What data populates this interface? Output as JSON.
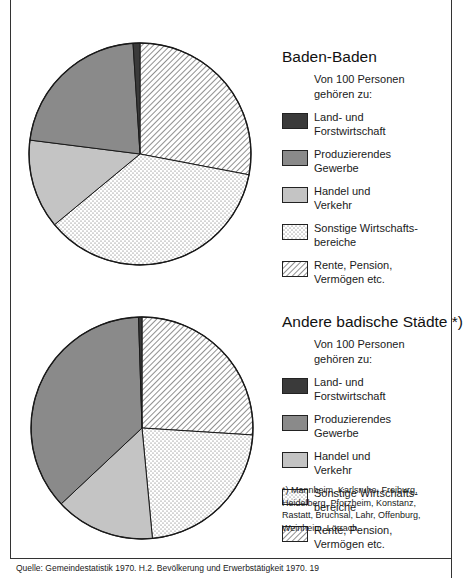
{
  "chart_data": [
    {
      "type": "pie",
      "title": "Baden-Baden",
      "subtitle": "Von 100 Personen gehören zu:",
      "unit": "persons per 100",
      "categories": [
        "Land- und Forstwirtschaft",
        "Produzierendes Gewerbe",
        "Handel und Verkehr",
        "Sonstige Wirtschaftsbereiche",
        "Rente, Pension, Vermögen etc."
      ],
      "values": [
        1,
        22,
        13,
        36,
        28
      ],
      "start_angle_deg": 0,
      "direction": "counterclockwise-from-top for order Land → Produzierendes → Handel → Sonstige → Rente",
      "legend_position": "right"
    },
    {
      "type": "pie",
      "title": "Andere badische Städte *)",
      "subtitle": "Von 100 Personen gehören zu:",
      "unit": "persons per 100",
      "categories": [
        "Land- und Forstwirtschaft",
        "Produzierendes Gewerbe",
        "Handel und Verkehr",
        "Sonstige Wirtschaftsbereiche",
        "Rente, Pension, Vermögen etc."
      ],
      "values": [
        0.5,
        36.5,
        14.5,
        22.5,
        26
      ],
      "start_angle_deg": 0,
      "legend_position": "right",
      "footnote": "*) Mannheim, Karlsruhe, Freiburg, Heidelberg, Pforzheim, Konstanz, Rastatt, Bruchsal, Lahr, Offenburg, Weinheim, Lörrach."
    }
  ],
  "colors": {
    "land": "#3a3a3a",
    "produzierendes": "#8a8a8a",
    "handel": "#c4c4c4",
    "sonstige": "dotted",
    "rente": "hatched",
    "outline": "#1a1a1a"
  },
  "charts": [
    {
      "title": "Baden-Baden",
      "subtitle_line1": "Von 100 Personen",
      "subtitle_line2": "gehören zu:",
      "legend": [
        {
          "line1": "Land- und",
          "line2": "Forstwirtschaft"
        },
        {
          "line1": "Produzierendes",
          "line2": "Gewerbe"
        },
        {
          "line1": "Handel und",
          "line2": "Verkehr"
        },
        {
          "line1": "Sonstige Wirtschafts-",
          "line2": "bereiche"
        },
        {
          "line1": "Rente, Pension,",
          "line2": "Vermögen etc."
        }
      ]
    },
    {
      "title": "Andere badische Städte *)",
      "subtitle_line1": "Von 100 Personen",
      "subtitle_line2": "gehören zu:",
      "legend": [
        {
          "line1": "Land- und",
          "line2": "Forstwirtschaft"
        },
        {
          "line1": "Produzierendes",
          "line2": "Gewerbe"
        },
        {
          "line1": "Handel und",
          "line2": "Verkehr"
        },
        {
          "line1": "Sonstige Wirtschafts-",
          "line2": "bereiche"
        },
        {
          "line1": "Rente, Pension,",
          "line2": "Vermögen etc."
        }
      ],
      "footnote": "*) Mannheim, Karlsruhe, Freiburg, Heidelberg, Pforzheim, Konstanz, Rastatt, Bruchsal, Lahr, Offenburg, Weinheim, Lörrach."
    }
  ],
  "source": "Quelle: Gemeindestatistik 1970. H.2. Bevölkerung und Erwerbstätigkeit 1970. 19"
}
